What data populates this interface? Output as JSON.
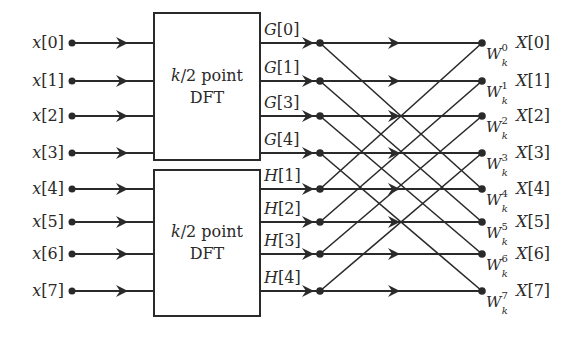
{
  "diagram": {
    "type": "fft-butterfly",
    "inputs": [
      "x[0]",
      "x[1]",
      "x[2]",
      "x[3]",
      "x[4]",
      "x[5]",
      "x[6]",
      "x[7]"
    ],
    "blocks": [
      {
        "line1": "k/2 point",
        "line2": "DFT"
      },
      {
        "line1": "k/2 point",
        "line2": "DFT"
      }
    ],
    "block_outputs": [
      "G[0]",
      "G[1]",
      "G[3]",
      "G[4]",
      "H[1]",
      "H[2]",
      "H[3]",
      "H[4]"
    ],
    "twiddles": [
      {
        "base": "W",
        "sub": "k",
        "sup": "0"
      },
      {
        "base": "W",
        "sub": "k",
        "sup": "1"
      },
      {
        "base": "W",
        "sub": "k",
        "sup": "2"
      },
      {
        "base": "W",
        "sub": "k",
        "sup": "3"
      },
      {
        "base": "W",
        "sub": "k",
        "sup": "4"
      },
      {
        "base": "W",
        "sub": "k",
        "sup": "5"
      },
      {
        "base": "W",
        "sub": "k",
        "sup": "6"
      },
      {
        "base": "W",
        "sub": "k",
        "sup": "7"
      }
    ],
    "outputs": [
      "X[0]",
      "X[1]",
      "X[2]",
      "X[3]",
      "X[4]",
      "X[5]",
      "X[6]",
      "X[7]"
    ],
    "colors": {
      "stroke": "#2a2a2a",
      "background": "#ffffff"
    }
  }
}
